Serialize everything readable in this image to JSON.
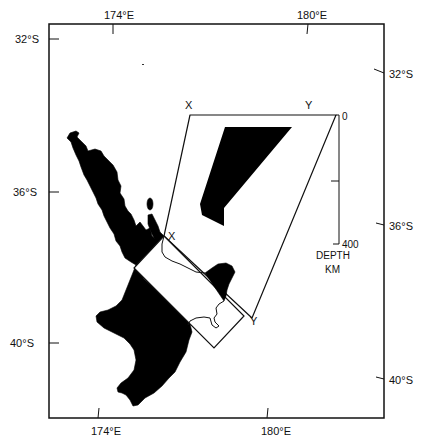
{
  "map": {
    "title": "",
    "frame": {
      "top_labels": [
        "174°E",
        "180°E"
      ],
      "bottom_labels": [
        "174°E",
        "180°E"
      ],
      "left_labels": [
        "32°S",
        "36°S",
        "40°S"
      ],
      "right_labels": [
        "32°S",
        "36°S",
        "40°S"
      ]
    },
    "section": {
      "start_label_top": "X",
      "end_label_top": "Y",
      "start_label_land": "X",
      "end_label_land": "Y"
    },
    "depth_scale": {
      "top_value": "0",
      "bottom_value": "400",
      "title_line1": "DEPTH",
      "title_line2": "KM"
    },
    "features": [
      {
        "name": "North Island of New Zealand",
        "fill": "#000000"
      },
      {
        "name": "Subducting slab depth region",
        "fill": "#000000"
      },
      {
        "name": "Cross-section box X–Y",
        "fill": "#ffffff"
      },
      {
        "name": "Projection area outline",
        "fill": "none"
      }
    ],
    "colors": {
      "ink": "#111111",
      "background": "#ffffff"
    }
  }
}
